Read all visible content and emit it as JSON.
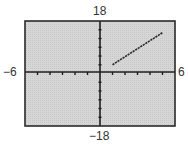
{
  "window": {
    "xmin_label": "−6",
    "xmax_label": "6",
    "ymin_label": "−18",
    "ymax_label": "18"
  },
  "colors": {
    "screen_bg": "#d4d4d4",
    "frame": "#2a2a2a",
    "axis": "#1e1e1e",
    "graph": "#2a2a2a"
  },
  "chart_data": {
    "type": "line",
    "title": "",
    "xlabel": "",
    "ylabel": "",
    "xlim": [
      -6,
      6
    ],
    "ylim": [
      -18,
      18
    ],
    "xscale": 1,
    "yscale": 3,
    "grid": false,
    "legend": null,
    "tick_labels": {
      "x": [
        "−6",
        "6"
      ],
      "y": [
        "−18",
        "18"
      ]
    },
    "series": [
      {
        "name": "graph",
        "x": [
          1,
          5
        ],
        "y": [
          3,
          14
        ]
      }
    ]
  }
}
